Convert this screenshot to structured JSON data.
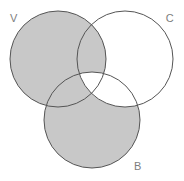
{
  "figure": {
    "kind": "venn-diagram",
    "width": 184,
    "height": 181,
    "background_color": "#ffffff"
  },
  "style": {
    "shade_color": "#c8c8c8",
    "unshaded_color": "#ffffff",
    "stroke_color": "#555555",
    "stroke_width": 1,
    "label_color": "#7d7d7d",
    "label_font_size": 11
  },
  "sets": [
    {
      "id": "V",
      "label": "V",
      "label_x": 14,
      "label_y": 19,
      "cx": 58,
      "cy": 59,
      "r": 48
    },
    {
      "id": "C",
      "label": "C",
      "label_x": 170,
      "label_y": 19,
      "cx": 125,
      "cy": 59,
      "r": 48
    },
    {
      "id": "B",
      "label": "B",
      "label_x": 138,
      "label_y": 167,
      "cx": 92,
      "cy": 120,
      "r": 48
    }
  ],
  "regions": [
    {
      "id": "V-only",
      "sets": [
        "V"
      ],
      "shaded": true,
      "description": "V only"
    },
    {
      "id": "C-only",
      "sets": [
        "C"
      ],
      "shaded": false,
      "description": "C only"
    },
    {
      "id": "B-only",
      "sets": [
        "B"
      ],
      "shaded": true,
      "description": "B only"
    },
    {
      "id": "V-and-C",
      "sets": [
        "V",
        "C"
      ],
      "shaded": true,
      "description": "V intersect C, not B"
    },
    {
      "id": "V-and-B",
      "sets": [
        "V",
        "B"
      ],
      "shaded": true,
      "description": "V intersect B, not C"
    },
    {
      "id": "C-and-B",
      "sets": [
        "C",
        "B"
      ],
      "shaded": false,
      "description": "C intersect B, not V"
    },
    {
      "id": "V-C-B",
      "sets": [
        "V",
        "C",
        "B"
      ],
      "shaded": false,
      "description": "triple intersection"
    }
  ],
  "shaded_expression": "V ∪ (B − C)"
}
